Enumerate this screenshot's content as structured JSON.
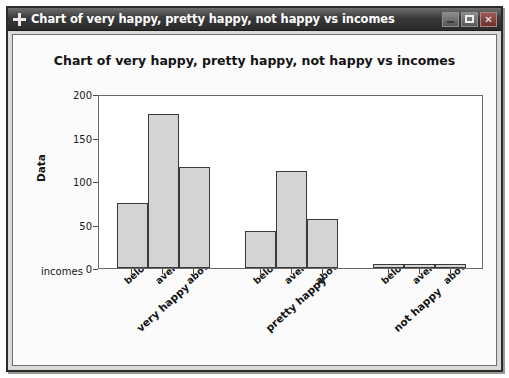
{
  "window": {
    "title": "Chart of very happy, pretty happy, not happy vs incomes",
    "icon": "move-crosshair-icon",
    "buttons": {
      "minimize": "minimize-button",
      "maximize": "maximize-button",
      "close": "✕"
    }
  },
  "chart_data": {
    "type": "bar",
    "title": "Chart of very happy, pretty happy, not happy vs incomes",
    "xlabel": "incomes",
    "ylabel": "Data",
    "ylim": [
      0,
      200
    ],
    "yticks": [
      0,
      50,
      100,
      150,
      200
    ],
    "grid": false,
    "legend": "none",
    "categories": [
      "below",
      "average",
      "above"
    ],
    "groups": [
      {
        "name": "very happy",
        "categories": [
          "below",
          "average",
          "above"
        ],
        "values": [
          75,
          177,
          116
        ]
      },
      {
        "name": "pretty happy",
        "categories": [
          "below",
          "average",
          "above"
        ],
        "values": [
          42,
          112,
          56
        ]
      },
      {
        "name": "not happy",
        "categories": [
          "below",
          "average",
          "above"
        ],
        "values": [
          5,
          5,
          5
        ]
      }
    ],
    "bar_fill_color": "#d4d4d4",
    "bar_edge_color": "#3a3a3a"
  }
}
